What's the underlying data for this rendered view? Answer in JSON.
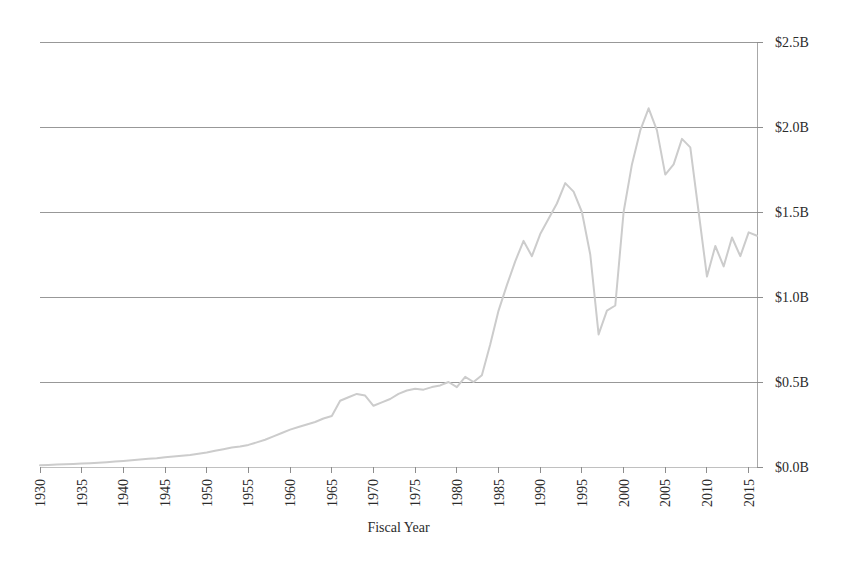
{
  "chart_data": {
    "type": "line",
    "title": "",
    "subtitle": "",
    "xlabel": "Fiscal Year",
    "ylabel": "",
    "xlim": [
      1930,
      2016
    ],
    "ylim": [
      0.0,
      2.5
    ],
    "grid": true,
    "grid_axis": "y",
    "legend": false,
    "legend_position": "none",
    "y_axis_side": "right",
    "x_tick_rotation": 90,
    "y_unit": "B",
    "y_prefix": "$",
    "x_ticks": [
      1930,
      1935,
      1940,
      1945,
      1950,
      1955,
      1960,
      1965,
      1970,
      1975,
      1980,
      1985,
      1990,
      1995,
      2000,
      2005,
      2010,
      2015
    ],
    "x_tick_labels": [
      "1930",
      "1935",
      "1940",
      "1945",
      "1950",
      "1955",
      "1960",
      "1965",
      "1970",
      "1975",
      "1980",
      "1985",
      "1990",
      "1995",
      "2000",
      "2005",
      "2010",
      "2015"
    ],
    "y_ticks": [
      0.0,
      0.5,
      1.0,
      1.5,
      2.0,
      2.5
    ],
    "y_tick_labels": [
      "$0.0B",
      "$0.5B",
      "$1.0B",
      "$1.5B",
      "$2.0B",
      "$2.5B"
    ],
    "series": [
      {
        "name": "Amount",
        "color": "#cccccc",
        "line_width": 2,
        "x": [
          1930,
          1931,
          1932,
          1933,
          1934,
          1935,
          1936,
          1937,
          1938,
          1939,
          1940,
          1941,
          1942,
          1943,
          1944,
          1945,
          1946,
          1947,
          1948,
          1949,
          1950,
          1951,
          1952,
          1953,
          1954,
          1955,
          1956,
          1957,
          1958,
          1959,
          1960,
          1961,
          1962,
          1963,
          1964,
          1965,
          1966,
          1967,
          1968,
          1969,
          1970,
          1971,
          1972,
          1973,
          1974,
          1975,
          1976,
          1977,
          1978,
          1979,
          1980,
          1981,
          1982,
          1983,
          1984,
          1985,
          1986,
          1987,
          1988,
          1989,
          1990,
          1991,
          1992,
          1993,
          1994,
          1995,
          1996,
          1997,
          1998,
          1999,
          2000,
          2001,
          2002,
          2003,
          2004,
          2005,
          2006,
          2007,
          2008,
          2009,
          2010,
          2011,
          2012,
          2013,
          2014,
          2015,
          2016
        ],
        "values": [
          0.01,
          0.012,
          0.014,
          0.016,
          0.018,
          0.02,
          0.022,
          0.025,
          0.028,
          0.032,
          0.036,
          0.04,
          0.044,
          0.048,
          0.052,
          0.058,
          0.062,
          0.066,
          0.07,
          0.078,
          0.085,
          0.095,
          0.105,
          0.115,
          0.12,
          0.13,
          0.145,
          0.16,
          0.18,
          0.2,
          0.22,
          0.235,
          0.25,
          0.265,
          0.285,
          0.3,
          0.39,
          0.41,
          0.43,
          0.42,
          0.36,
          0.38,
          0.4,
          0.43,
          0.45,
          0.46,
          0.455,
          0.47,
          0.48,
          0.5,
          0.47,
          0.53,
          0.5,
          0.54,
          0.72,
          0.92,
          1.07,
          1.21,
          1.33,
          1.24,
          1.37,
          1.46,
          1.55,
          1.67,
          1.62,
          1.5,
          1.25,
          0.78,
          0.92,
          0.95,
          1.5,
          1.78,
          1.98,
          2.11,
          1.98,
          1.72,
          1.78,
          1.93,
          1.88,
          1.5,
          1.12,
          1.3,
          1.18,
          1.35,
          1.24,
          1.38,
          1.36
        ]
      }
    ]
  },
  "axes": {
    "x_axis_title": "Fiscal Year"
  }
}
